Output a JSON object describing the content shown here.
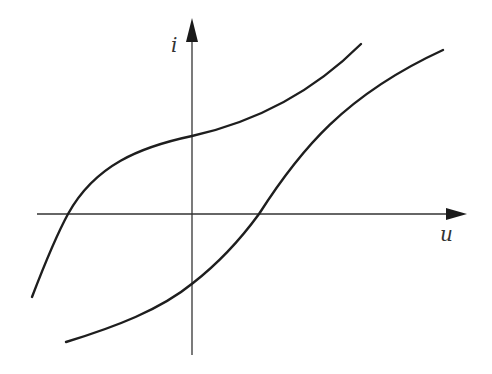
{
  "diagram": {
    "type": "i-u characteristic curves",
    "axes": {
      "vertical": {
        "label": "i",
        "x": 192,
        "y_top": 18,
        "y_bottom": 355
      },
      "horizontal": {
        "label": "u",
        "y": 214,
        "x_left": 37,
        "x_right": 467
      }
    },
    "curves": [
      {
        "name": "upper-curve",
        "path": "M 32 297 C 50 250, 62 225, 68 214 C 95 165, 140 147, 192 136 C 250 123, 310 95, 361 44"
      },
      {
        "name": "lower-curve",
        "path": "M 66 342 C 115 327, 160 310, 193 283 C 220 262, 240 240, 259 214 C 300 150, 345 95, 443 50"
      }
    ],
    "colors": {
      "axis": "#333333",
      "curve": "#1e1e1e",
      "background": "#ffffff"
    }
  }
}
